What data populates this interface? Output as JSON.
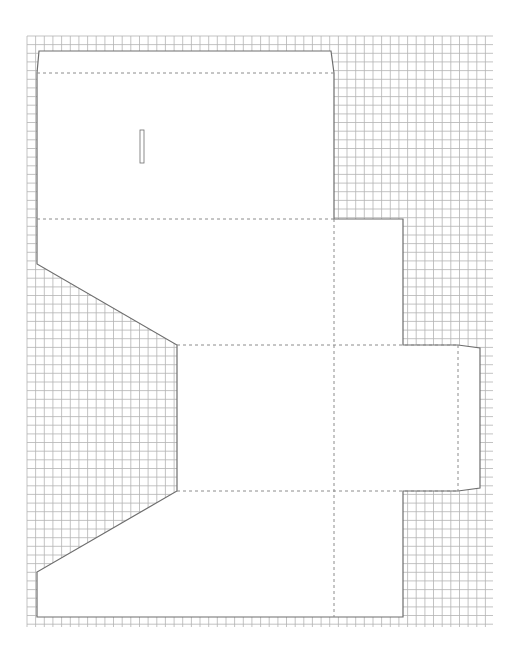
{
  "diagram": {
    "type": "box-die-cut-template",
    "background": "#ffffff",
    "grid": {
      "x": 27,
      "y": 36,
      "width": 466,
      "height": 591,
      "cell": 8.65,
      "line_color": "#b4b4b4"
    },
    "stroke": {
      "cut_color": "#6e6e6e",
      "fold_color": "#8c8c8c",
      "fill": "#ffffff"
    },
    "outline": [
      [
        39,
        51
      ],
      [
        331,
        51
      ],
      [
        334,
        73
      ],
      [
        334,
        219
      ],
      [
        403,
        219
      ],
      [
        403,
        345
      ],
      [
        458,
        345
      ],
      [
        480,
        348
      ],
      [
        480,
        488
      ],
      [
        458,
        491
      ],
      [
        403,
        491
      ],
      [
        403,
        617
      ],
      [
        37,
        617
      ],
      [
        37,
        572
      ],
      [
        177,
        491
      ],
      [
        177,
        345
      ],
      [
        37,
        264
      ],
      [
        37,
        73
      ]
    ],
    "fold_lines": [
      {
        "x1": 37,
        "y1": 73,
        "x2": 334,
        "y2": 73
      },
      {
        "x1": 37,
        "y1": 219,
        "x2": 334,
        "y2": 219
      },
      {
        "x1": 177,
        "y1": 345,
        "x2": 458,
        "y2": 345
      },
      {
        "x1": 177,
        "y1": 491,
        "x2": 458,
        "y2": 491
      },
      {
        "x1": 334,
        "y1": 219,
        "x2": 334,
        "y2": 617
      },
      {
        "x1": 458,
        "y1": 345,
        "x2": 458,
        "y2": 491
      }
    ],
    "slot": {
      "x": 140,
      "y": 130,
      "width": 4,
      "height": 33
    }
  }
}
